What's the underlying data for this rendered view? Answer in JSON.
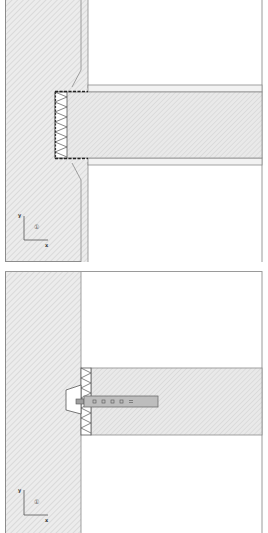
{
  "diagram": {
    "type": "construction-detail",
    "panels": [
      {
        "id": "top",
        "description": "Wall with jamb/frame and horizontal timber member, insulated gap with tapered reveals",
        "axis": {
          "y_label": "y",
          "x_label": "x",
          "marker": "①"
        }
      },
      {
        "id": "bottom",
        "description": "Wall with horizontal timber member, insulated joint, wedge and perforated connector plate",
        "axis": {
          "y_label": "y",
          "x_label": "x",
          "marker": "①"
        }
      }
    ],
    "colors": {
      "hatch_fill": "#ebebeb",
      "hatch_line": "#c8c8c8",
      "outline": "#8c8c8c",
      "dark_line": "#333333",
      "connector_fill": "#bdbdbd",
      "background": "#ffffff"
    }
  }
}
